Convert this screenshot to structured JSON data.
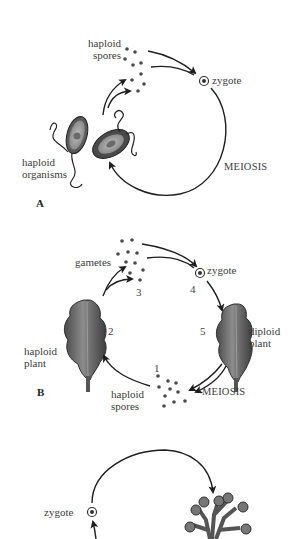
{
  "panels": {
    "A": {
      "letter": "A",
      "labels": {
        "haploid_spores": [
          "haploid",
          "spores"
        ],
        "zygote": "zygote",
        "haploid_organisms": [
          "haploid",
          "organisms"
        ],
        "meiosis": "MEIOSIS"
      }
    },
    "B": {
      "letter": "B",
      "labels": {
        "gametes": "gametes",
        "zygote": "zygote",
        "haploid_plant": [
          "haploid",
          "plant"
        ],
        "diploid_plant": [
          "diploid",
          "plant"
        ],
        "haploid_spores": [
          "haploid",
          "spores"
        ],
        "meiosis": "MEIOSIS"
      },
      "stage_numbers": [
        "1",
        "2",
        "3",
        "4",
        "5"
      ]
    },
    "C": {
      "labels": {
        "zygote": "zygote"
      }
    }
  },
  "colors": {
    "line": "#1e1e1e",
    "dot": "#4a4a4a",
    "plant_fill": "#6f6f6f",
    "plant_dark": "#3f3f3f",
    "text": "#3c3c3c"
  }
}
